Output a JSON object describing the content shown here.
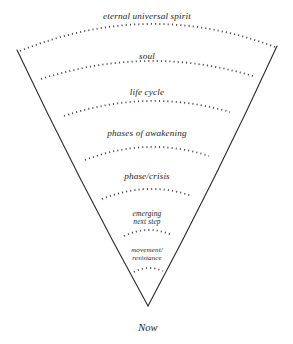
{
  "diagram": {
    "background_color": "#ffffff",
    "line_color": "#2b2b2b",
    "arc_color": "#4a4a4a",
    "text_color": "#1c1c1c",
    "apex": {
      "label": "Now",
      "x": 148,
      "y": 322,
      "font_size": 10.5
    },
    "edges": {
      "left_top_x": 17,
      "left_top_y": 50,
      "right_top_x": 277,
      "right_top_y": 46,
      "apex_x": 148,
      "apex_y": 306
    },
    "bands": [
      {
        "label": "eternal universal spirit",
        "label_x": 147,
        "label_y": 11,
        "font_size": 9.2,
        "arc": {
          "x1": 20,
          "y1": 51,
          "cx": 148,
          "cy": 24,
          "x2": 275,
          "y2": 47
        }
      },
      {
        "label": "soul",
        "label_x": 147,
        "label_y": 51,
        "font_size": 9.2,
        "arc": {
          "x1": 41,
          "y1": 79,
          "cx": 148,
          "cy": 61,
          "x2": 253,
          "y2": 76
        }
      },
      {
        "label": "life cycle",
        "label_x": 147,
        "label_y": 87,
        "font_size": 9.2,
        "arc": {
          "x1": 64,
          "y1": 116,
          "cx": 148,
          "cy": 101,
          "x2": 230,
          "y2": 112
        }
      },
      {
        "label": "phases of awakening",
        "label_x": 147,
        "label_y": 128,
        "font_size": 9.2,
        "arc": {
          "x1": 85,
          "y1": 160,
          "cx": 148,
          "cy": 147,
          "x2": 209,
          "y2": 156
        }
      },
      {
        "label": "phase/crisis",
        "label_x": 147,
        "label_y": 171,
        "font_size": 9.2,
        "arc": {
          "x1": 102,
          "y1": 199,
          "cx": 148,
          "cy": 189,
          "x2": 192,
          "y2": 196
        }
      },
      {
        "label": "emerging\nnext step",
        "label_x": 147,
        "label_y": 210,
        "font_size": 7.4,
        "arc": {
          "x1": 124,
          "y1": 236,
          "cx": 148,
          "cy": 230,
          "x2": 172,
          "y2": 235
        }
      },
      {
        "label": "movement/\nresistance",
        "label_x": 147,
        "label_y": 247,
        "font_size": 7.0,
        "arc": {
          "x1": 134,
          "y1": 272,
          "cx": 148,
          "cy": 268,
          "x2": 163,
          "y2": 271
        }
      }
    ]
  }
}
